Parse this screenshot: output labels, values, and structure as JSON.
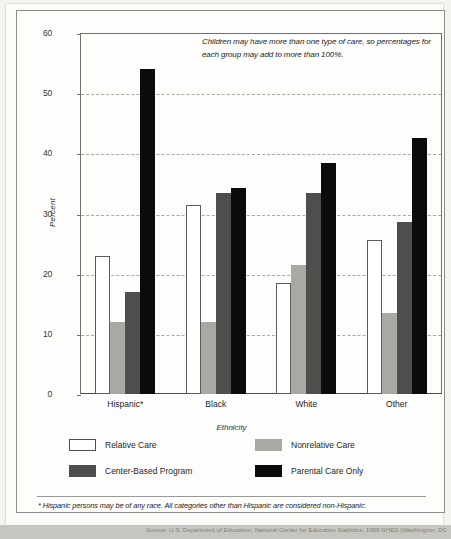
{
  "chart_data": {
    "type": "bar",
    "title": "",
    "xlabel": "Ethnicity",
    "ylabel": "Percent",
    "ylim": [
      0,
      60
    ],
    "yticks": [
      0,
      10,
      20,
      30,
      40,
      50,
      60
    ],
    "grid": true,
    "legend_position": "bottom",
    "categories": [
      "Hispanic*",
      "Black",
      "White",
      "Other"
    ],
    "series": [
      {
        "name": "Relative Care",
        "color": "#ffffff",
        "values": [
          23.0,
          31.4,
          18.4,
          25.6
        ]
      },
      {
        "name": "Nonrelative Care",
        "color": "#a8a8a4",
        "values": [
          12.0,
          12.0,
          21.5,
          13.5
        ]
      },
      {
        "name": "Center-Based Program",
        "color": "#4e4e4c",
        "values": [
          17.0,
          33.4,
          33.4,
          28.6
        ]
      },
      {
        "name": "Parental Care Only",
        "color": "#0b0b0b",
        "values": [
          54.0,
          34.2,
          38.4,
          42.5
        ]
      }
    ],
    "annotation": "Children may have more than one type of care, so percentages for each group may add to more than 100%.",
    "footnote": "* Hispanic persons may be of any race. All categories other than Hispanic are considered non-Hispanic."
  },
  "axis": {
    "ylabel": "Percent",
    "xlabel": "Ethnicity",
    "yticks": [
      "60",
      "50",
      "40",
      "30",
      "20",
      "10",
      "0"
    ]
  },
  "groups": [
    {
      "label": "Hispanic*"
    },
    {
      "label": "Black"
    },
    {
      "label": "White"
    },
    {
      "label": "Other"
    }
  ],
  "legend": [
    {
      "label": "Relative Care"
    },
    {
      "label": "Nonrelative Care"
    },
    {
      "label": "Center-Based Program"
    },
    {
      "label": "Parental Care Only"
    }
  ],
  "annotation": "Children may have more than one type of care, so percentages for each group may add to more than 100%.",
  "footnote": "* Hispanic persons may be of any race. All categories other than Hispanic are considered non-Hispanic.",
  "source_strip": "Source: U.S. Department of Education, National Center for Education Statistics, 1999 NHES (Washington, DC"
}
